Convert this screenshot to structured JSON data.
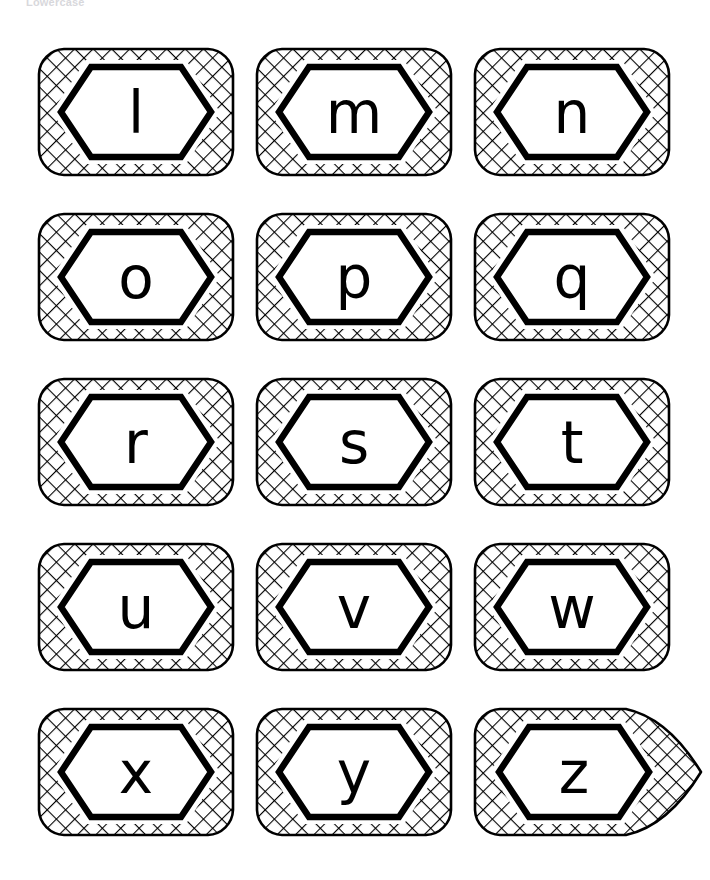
{
  "page": {
    "title": "Lowercase",
    "background_color": "#ffffff",
    "ink_color": "#000000",
    "title_color": "#d8d8dc"
  },
  "grid": {
    "rows": 5,
    "columns": 3,
    "card_count": 15
  },
  "cards": [
    {
      "letter": "l",
      "row": 0,
      "col": 0,
      "shape": "rounded-rect",
      "x": 38,
      "y": 48,
      "hatched": true
    },
    {
      "letter": "m",
      "row": 0,
      "col": 1,
      "shape": "rounded-rect",
      "x": 256,
      "y": 48,
      "hatched": true
    },
    {
      "letter": "n",
      "row": 0,
      "col": 2,
      "shape": "rounded-rect",
      "x": 474,
      "y": 48,
      "hatched": true
    },
    {
      "letter": "o",
      "row": 1,
      "col": 0,
      "shape": "rounded-rect",
      "x": 38,
      "y": 213,
      "hatched": true
    },
    {
      "letter": "p",
      "row": 1,
      "col": 1,
      "shape": "rounded-rect",
      "x": 256,
      "y": 213,
      "hatched": true
    },
    {
      "letter": "q",
      "row": 1,
      "col": 2,
      "shape": "rounded-rect",
      "x": 474,
      "y": 213,
      "hatched": true
    },
    {
      "letter": "r",
      "row": 2,
      "col": 0,
      "shape": "rounded-rect",
      "x": 38,
      "y": 378,
      "hatched": true
    },
    {
      "letter": "s",
      "row": 2,
      "col": 1,
      "shape": "rounded-rect",
      "x": 256,
      "y": 378,
      "hatched": true
    },
    {
      "letter": "t",
      "row": 2,
      "col": 2,
      "shape": "rounded-rect",
      "x": 474,
      "y": 378,
      "hatched": true
    },
    {
      "letter": "u",
      "row": 3,
      "col": 0,
      "shape": "rounded-rect",
      "x": 38,
      "y": 543,
      "hatched": true
    },
    {
      "letter": "v",
      "row": 3,
      "col": 1,
      "shape": "rounded-rect",
      "x": 256,
      "y": 543,
      "hatched": true
    },
    {
      "letter": "w",
      "row": 3,
      "col": 2,
      "shape": "rounded-rect",
      "x": 474,
      "y": 543,
      "hatched": true
    },
    {
      "letter": "x",
      "row": 4,
      "col": 0,
      "shape": "rounded-rect",
      "x": 38,
      "y": 708,
      "hatched": true
    },
    {
      "letter": "y",
      "row": 4,
      "col": 1,
      "shape": "rounded-rect",
      "x": 256,
      "y": 708,
      "hatched": true
    },
    {
      "letter": "z",
      "row": 4,
      "col": 2,
      "shape": "tail-point",
      "x": 474,
      "y": 708,
      "hatched": true
    }
  ]
}
